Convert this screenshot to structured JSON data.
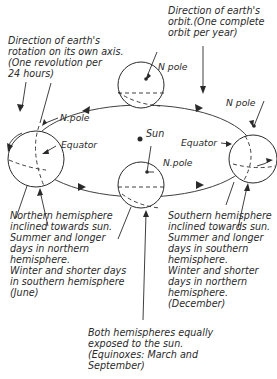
{
  "diagram": {
    "labels": {
      "rotation": [
        "Direction of earth's",
        "rotation on its own axis.",
        "(One revolution per",
        "24 hours)"
      ],
      "orbit": [
        "Direction of earth's",
        "orbit.(One complete",
        "orbit per year)"
      ],
      "sun": "Sun",
      "n_pole_top": "N pole",
      "n_pole_left": "N.pole",
      "n_pole_right": "N pole",
      "n_pole_bottom": "N.pole",
      "equator_left": "Equator",
      "equator_right": "Equator",
      "june": [
        "Northern hemisphere",
        "inclined towards sun.",
        "Summer and longer",
        "days in northern",
        "hemisphere.",
        "Winter and shorter days",
        "in southern hemisphere",
        "(June)"
      ],
      "december": [
        "Southern hemisphere",
        "inclined towards sun.",
        "Summer and longer",
        "days  in southern",
        "hemisphere.",
        "Winter and shorter",
        "days in northern",
        "hemisphere.",
        "(December)"
      ],
      "equinox": [
        "Both hemispheres equally",
        "exposed to the sun.",
        "(Equinoxes: March and",
        "September)"
      ]
    },
    "positions": {
      "sun": {
        "x": 140,
        "y": 139
      },
      "globe_top": {
        "x": 141,
        "y": 85,
        "r": 23
      },
      "globe_left": {
        "x": 36,
        "y": 159,
        "r": 28
      },
      "globe_right": {
        "x": 253,
        "y": 159,
        "r": 24
      },
      "globe_bottom": {
        "x": 141,
        "y": 185,
        "r": 23
      }
    }
  }
}
